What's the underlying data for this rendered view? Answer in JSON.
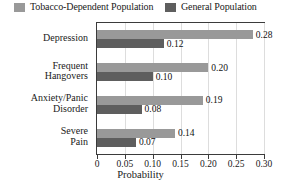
{
  "chart_data": {
    "type": "bar",
    "orientation": "horizontal",
    "title": "",
    "xlabel": "Probability",
    "ylabel": "",
    "xlim": [
      0,
      0.3
    ],
    "xticks": [
      "0",
      "0.05",
      "0.10",
      "0.15",
      "0.20",
      "0.25",
      "0.30"
    ],
    "xtick_values": [
      0,
      0.05,
      0.1,
      0.15,
      0.2,
      0.25,
      0.3
    ],
    "grid": true,
    "legend_position": "top",
    "categories": [
      "Depression",
      "Frequent Hangovers",
      "Anxiety/Panic Disorder",
      "Severe Pain"
    ],
    "category_lines": [
      [
        "Depression"
      ],
      [
        "Frequent",
        "Hangovers"
      ],
      [
        "Anxiety/Panic",
        "Disorder"
      ],
      [
        "Severe",
        "Pain"
      ]
    ],
    "series": [
      {
        "name": "Tobacco-Dependent Population",
        "color": "#999999",
        "values": [
          0.28,
          0.2,
          0.19,
          0.14
        ],
        "labels": [
          "0.28",
          "0.20",
          "0.19",
          "0.14"
        ]
      },
      {
        "name": "General Population",
        "color": "#5e5e5e",
        "values": [
          0.12,
          0.1,
          0.08,
          0.07
        ],
        "labels": [
          "0.12",
          "0.10",
          "0.08",
          "0.07"
        ]
      }
    ]
  },
  "legend": {
    "items": [
      {
        "label": "Tobacco-Dependent Population",
        "color": "#999999"
      },
      {
        "label": "General Population",
        "color": "#5e5e5e"
      }
    ]
  },
  "axis": {
    "x_title": "Probability"
  }
}
